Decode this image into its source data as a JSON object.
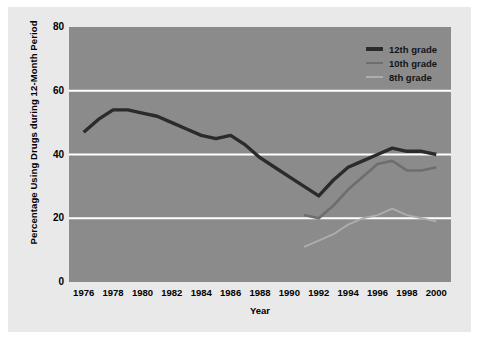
{
  "chart_data": {
    "type": "line",
    "title": "",
    "xlabel": "Year",
    "ylabel": "Percentage Using Drugs during 12-Month Period",
    "xlim": [
      1975,
      2001
    ],
    "ylim": [
      0,
      80
    ],
    "yticks": [
      0,
      20,
      40,
      60,
      80
    ],
    "xticks": [
      1976,
      1978,
      1980,
      1982,
      1984,
      1986,
      1988,
      1990,
      1992,
      1994,
      1996,
      1998,
      2000
    ],
    "grid": "horizontal-white-gridlines",
    "legend_position": "top-right-inside",
    "plot_background": "#8b8b8b",
    "figure_background": "#e9e9e9",
    "gridline_color": "#ffffff",
    "series": [
      {
        "name": "12th grade",
        "color": "#2b2b2b",
        "x": [
          1976,
          1977,
          1978,
          1979,
          1980,
          1981,
          1982,
          1983,
          1984,
          1985,
          1986,
          1987,
          1988,
          1989,
          1990,
          1991,
          1992,
          1993,
          1994,
          1995,
          1996,
          1997,
          1998,
          1999,
          2000
        ],
        "values": [
          47,
          51,
          54,
          54,
          53,
          52,
          50,
          48,
          46,
          45,
          46,
          43,
          39,
          36,
          33,
          30,
          27,
          32,
          36,
          38,
          40,
          42,
          41,
          41,
          40
        ]
      },
      {
        "name": "10th grade",
        "color": "#6e6e6e",
        "x": [
          1991,
          1992,
          1993,
          1994,
          1995,
          1996,
          1997,
          1998,
          1999,
          2000
        ],
        "values": [
          21,
          20,
          24,
          29,
          33,
          37,
          38,
          35,
          35,
          36
        ]
      },
      {
        "name": "8th grade",
        "color": "#adadad",
        "x": [
          1991,
          1992,
          1993,
          1994,
          1995,
          1996,
          1997,
          1998,
          1999,
          2000
        ],
        "values": [
          11,
          13,
          15,
          18,
          20,
          21,
          23,
          21,
          20,
          19
        ]
      }
    ]
  },
  "legend": {
    "items": [
      {
        "label": "12th grade",
        "color": "#2b2b2b"
      },
      {
        "label": "10th grade",
        "color": "#6e6e6e"
      },
      {
        "label": "8th grade",
        "color": "#adadad"
      }
    ]
  }
}
